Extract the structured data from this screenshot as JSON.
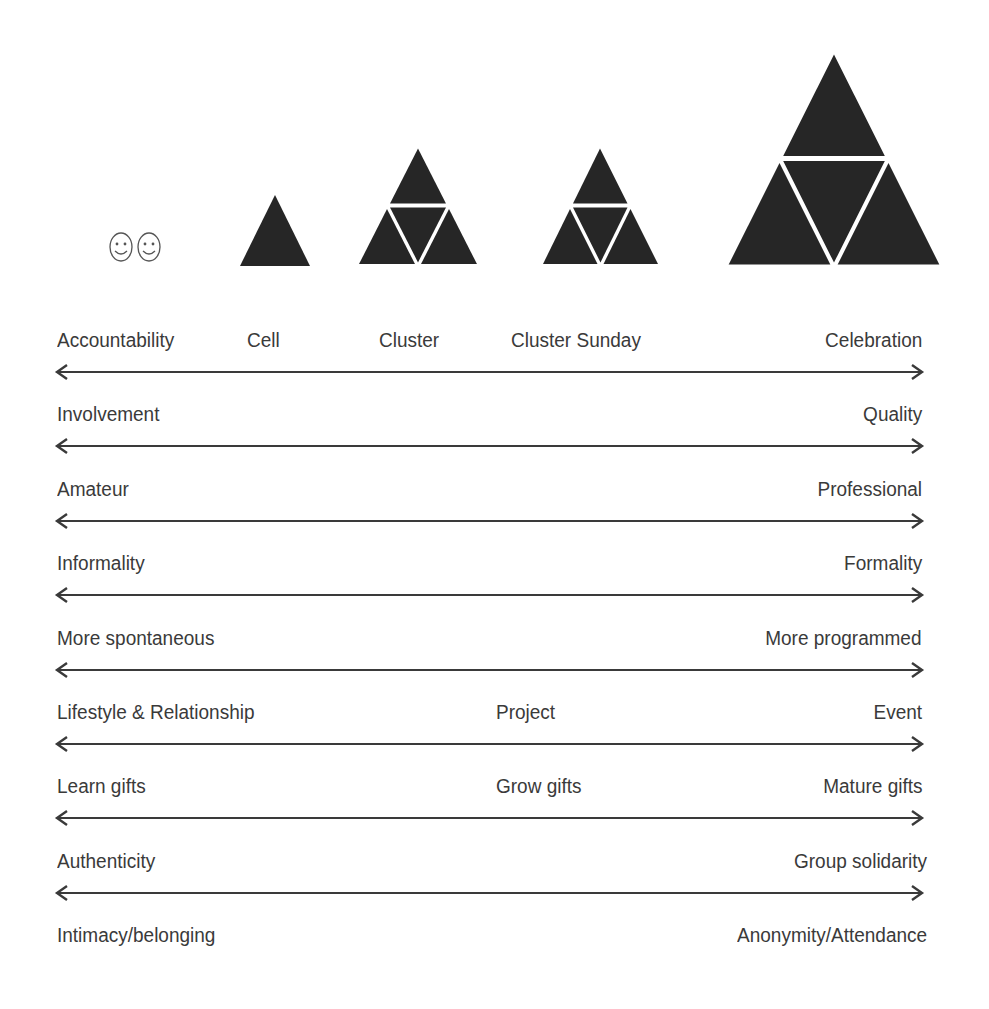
{
  "colors": {
    "shape_fill": "#262626",
    "text": "#3a3a3a",
    "arrow": "#3a3a3a",
    "background": "#ffffff"
  },
  "icons": {
    "pair": [
      {
        "name": "smiley-face-icon",
        "glyph": "☺"
      },
      {
        "name": "smiley-face-icon",
        "glyph": "☺"
      }
    ]
  },
  "scale_headers": [
    {
      "label": "Accountability",
      "x": 57,
      "align": "left"
    },
    {
      "label": "Cell",
      "x": 247,
      "align": "left"
    },
    {
      "label": "Cluster",
      "x": 379,
      "align": "left"
    },
    {
      "label": "Cluster Sunday",
      "x": 511,
      "align": "left"
    },
    {
      "label": "Celebration",
      "x": 922,
      "align": "right"
    }
  ],
  "group_shapes": [
    {
      "name": "accountability-pair",
      "type": "smileys",
      "cx": 135,
      "cy": 247
    },
    {
      "name": "cell",
      "type": "single-triangle",
      "apex": [
        275,
        195
      ],
      "base_left": [
        240,
        266
      ],
      "base_right": [
        310,
        266
      ]
    },
    {
      "name": "cluster",
      "type": "four-triangle",
      "apex": [
        418,
        145
      ],
      "base_left": [
        356,
        266
      ],
      "base_right": [
        480,
        266
      ]
    },
    {
      "name": "cluster-sunday",
      "type": "four-triangle",
      "apex": [
        600,
        145
      ],
      "base_left": [
        540,
        266
      ],
      "base_right": [
        661,
        266
      ]
    },
    {
      "name": "celebration",
      "type": "four-triangle",
      "apex": [
        834,
        50
      ],
      "base_left": [
        725,
        267
      ],
      "base_right": [
        943,
        267
      ]
    }
  ],
  "spectrum_rows": [
    {
      "left": "Involvement",
      "middle": "",
      "right": "Quality"
    },
    {
      "left": "Amateur",
      "middle": "",
      "right": "Professional"
    },
    {
      "left": "Informality",
      "middle": "",
      "right": "Formality"
    },
    {
      "left": "More spontaneous",
      "middle": "",
      "right": "More programmed"
    },
    {
      "left": "Lifestyle & Relationship",
      "middle": "Project",
      "right": "Event"
    },
    {
      "left": "Learn gifts",
      "middle": "Grow gifts",
      "right": "Mature gifts"
    },
    {
      "left": "Authenticity",
      "middle": "",
      "right": "Group solidarity"
    },
    {
      "left": "Intimacy/belonging",
      "middle": "",
      "right": "Anonymity/Attendance"
    }
  ],
  "layout": {
    "header_text_top": 328,
    "first_arrow_y": 372,
    "row_spacing": 74.4,
    "arrow_x_start": 57,
    "arrow_x_end": 922,
    "middle_x": 496,
    "right_x": 922
  }
}
